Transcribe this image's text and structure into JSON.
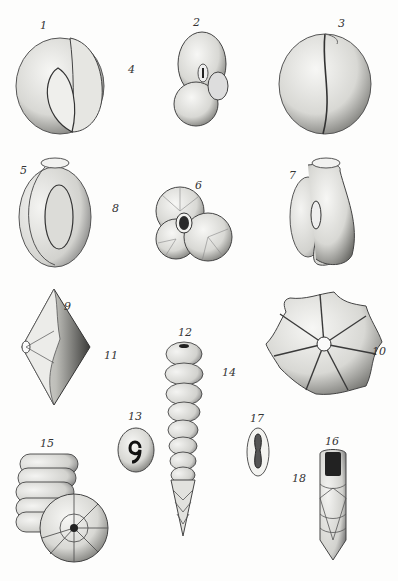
{
  "plate": {
    "type": "scientific illustration plate",
    "subject": "foraminifera specimens",
    "figures": [
      {
        "num": "1",
        "label": "1"
      },
      {
        "num": "2",
        "label": "2"
      },
      {
        "num": "3",
        "label": "3"
      },
      {
        "num": "4",
        "label": "4"
      },
      {
        "num": "5",
        "label": "5"
      },
      {
        "num": "6",
        "label": "6"
      },
      {
        "num": "7",
        "label": "7"
      },
      {
        "num": "8",
        "label": "8"
      },
      {
        "num": "9",
        "label": "9"
      },
      {
        "num": "10",
        "label": "10"
      },
      {
        "num": "11",
        "label": "11"
      },
      {
        "num": "12",
        "label": "12"
      },
      {
        "num": "13",
        "label": "13"
      },
      {
        "num": "14",
        "label": "14"
      },
      {
        "num": "15",
        "label": "15"
      },
      {
        "num": "16",
        "label": "16"
      },
      {
        "num": "17",
        "label": "17"
      },
      {
        "num": "18",
        "label": "18"
      }
    ]
  }
}
